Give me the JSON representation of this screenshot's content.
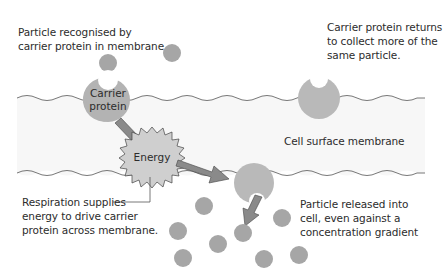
{
  "diagram": {
    "colors": {
      "particle": "#a6a6a6",
      "carrier": "#b7b7b7",
      "energy_fill": "#cfcfcf",
      "arrow_fill": "#8a8a8a",
      "membrane_band": "#f8f8f8",
      "membrane_line": "#555555",
      "text": "#2c2c2c"
    },
    "labels": {
      "particle_recognised": "Particle recognised by\ncarrier protein in membrane",
      "carrier_returns": "Carrier protein returns\nto collect more of the\nsame particle.",
      "cell_surface_membrane": "Cell surface membrane",
      "respiration": "Respiration supplies\nenergy to drive carrier\nprotein across membrane.",
      "particle_released": "Particle released into\ncell, even against a\nconcentration gradient",
      "carrier_protein": "Carrier\nprotein",
      "energy": "Energy"
    },
    "particles_outside": [
      {
        "x": 108,
        "y": 63
      },
      {
        "x": 172,
        "y": 53
      }
    ],
    "particles_inside": [
      {
        "x": 204,
        "y": 206
      },
      {
        "x": 178,
        "y": 231
      },
      {
        "x": 218,
        "y": 244
      },
      {
        "x": 183,
        "y": 258
      },
      {
        "x": 243,
        "y": 233
      },
      {
        "x": 282,
        "y": 218
      },
      {
        "x": 264,
        "y": 259
      },
      {
        "x": 299,
        "y": 255
      }
    ]
  }
}
